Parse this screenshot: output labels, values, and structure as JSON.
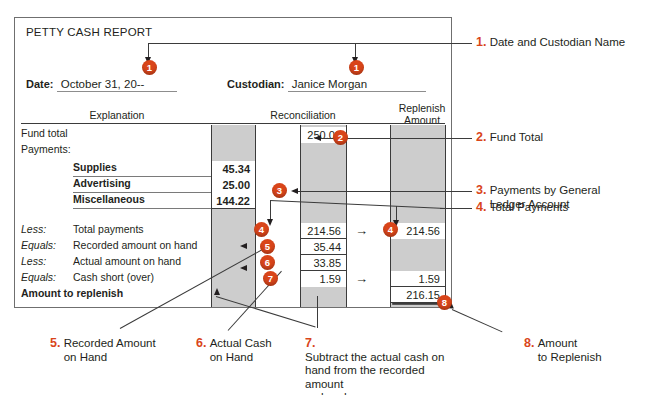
{
  "form": {
    "title": "PETTY CASH REPORT",
    "date_label": "Date:",
    "date_value": "October 31, 20--",
    "custodian_label": "Custodian:",
    "custodian_value": "Janice Morgan",
    "columns": {
      "explanation": "Explanation",
      "reconciliation": "Reconciliation",
      "replenish_line1": "Replenish",
      "replenish_line2": "Amount"
    },
    "rows": [
      {
        "prefix": "",
        "desc": "Fund total",
        "c1": "",
        "c2": "250.00",
        "c3": ""
      },
      {
        "prefix": "",
        "desc": "Payments:",
        "c1": "",
        "c2": "",
        "c3": ""
      },
      {
        "prefix": "",
        "desc": "Supplies",
        "c1": "45.34",
        "c2": "",
        "c3": ""
      },
      {
        "prefix": "",
        "desc": "Advertising",
        "c1": "25.00",
        "c2": "",
        "c3": ""
      },
      {
        "prefix": "",
        "desc": "Miscellaneous",
        "c1": "144.22",
        "c2": "",
        "c3": ""
      },
      {
        "prefix": "Less:",
        "desc": "Total payments",
        "c1": "",
        "c2": "214.56",
        "c3": "214.56"
      },
      {
        "prefix": "Equals:",
        "desc": "Recorded amount on hand",
        "c1": "",
        "c2": "35.44",
        "c3": ""
      },
      {
        "prefix": "Less:",
        "desc": "Actual amount on hand",
        "c1": "",
        "c2": "33.85",
        "c3": ""
      },
      {
        "prefix": "Equals:",
        "desc": "Cash short (over)",
        "c1": "",
        "c2": "1.59",
        "c3": "1.59"
      },
      {
        "prefix": "",
        "desc": "Amount to replenish",
        "c1": "",
        "c2": "",
        "c3": "216.15"
      }
    ],
    "flow_arrow": "→"
  },
  "badges": {
    "b1a": "1",
    "b1b": "1",
    "b2": "2",
    "b3": "3",
    "b4a": "4",
    "b4b": "4",
    "b5": "5",
    "b6": "6",
    "b7": "7",
    "b8": "8"
  },
  "notes": [
    {
      "num": "1.",
      "lines": [
        "Date and Custodian Name"
      ]
    },
    {
      "num": "2.",
      "lines": [
        "Fund Total"
      ]
    },
    {
      "num": "3.",
      "lines": [
        "Payments by General",
        "Ledger Account"
      ]
    },
    {
      "num": "4.",
      "lines": [
        "Total Payments"
      ]
    },
    {
      "num": "5.",
      "lines": [
        "Recorded Amount",
        "on Hand"
      ]
    },
    {
      "num": "6.",
      "lines": [
        "Actual Cash",
        "on Hand"
      ]
    },
    {
      "num": "7.",
      "lines": [
        "Subtract the actual cash on",
        "hand from the recorded amount",
        "on hand."
      ]
    },
    {
      "num": "8.",
      "lines": [
        "Amount",
        "to Replenish"
      ]
    }
  ],
  "colors": {
    "accent": "#d9451a",
    "band": "#cdcdcd",
    "rule": "#3b3b3b",
    "text": "#231f20"
  }
}
